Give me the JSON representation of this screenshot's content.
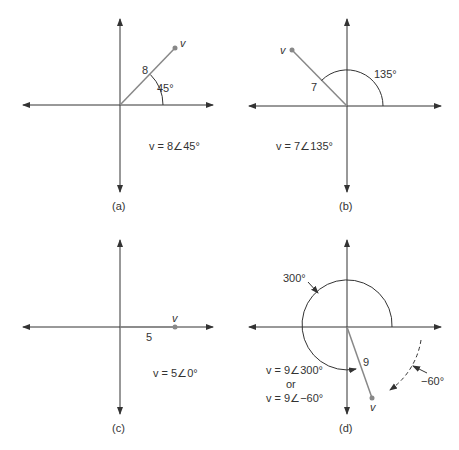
{
  "panels": [
    {
      "id": "a",
      "caption": "(a)",
      "magnitude_label": "8",
      "angle_label": "45°",
      "vector_label": "v",
      "equation": "v = 8∠45°",
      "magnitude": 8,
      "angle_deg": 45
    },
    {
      "id": "b",
      "caption": "(b)",
      "magnitude_label": "7",
      "angle_label": "135°",
      "vector_label": "v",
      "equation": "v = 7∠135°",
      "magnitude": 7,
      "angle_deg": 135
    },
    {
      "id": "c",
      "caption": "(c)",
      "magnitude_label": "5",
      "angle_label": "",
      "vector_label": "v",
      "equation": "v = 5∠0°",
      "magnitude": 5,
      "angle_deg": 0
    },
    {
      "id": "d",
      "caption": "(d)",
      "magnitude_label": "9",
      "angle_label": "300°",
      "neg_angle_label": "−60°",
      "vector_label": "v",
      "equation_1": "v = 9∠300°",
      "equation_or": "or",
      "equation_2": "v = 9∠−60°",
      "magnitude": 9,
      "angle_deg": 300,
      "alt_angle_deg": -60
    }
  ],
  "colors": {
    "axis": "#333333",
    "vector": "#888888",
    "point": "#888888",
    "text": "#333333"
  }
}
